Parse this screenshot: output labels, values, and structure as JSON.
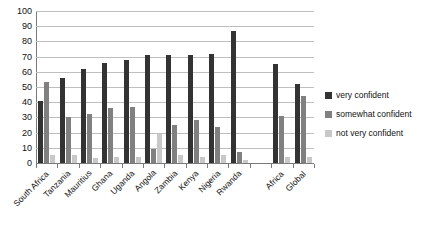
{
  "chart_data": {
    "type": "bar",
    "title": "",
    "subtitle": "",
    "xlabel": "",
    "ylabel": "",
    "ylim": [
      0,
      100
    ],
    "ytick_step": 10,
    "yticks": [
      "100",
      "90",
      "80",
      "70",
      "60",
      "50",
      "40",
      "30",
      "20",
      "10",
      "0"
    ],
    "grid": true,
    "legend_position": "right",
    "categories": [
      "South Africa",
      "Tanzania",
      "Mauritius",
      "Ghana",
      "Uganda",
      "Angola",
      "Zambia",
      "Kenya",
      "Nigeria",
      "Rwanda",
      "",
      "Africa",
      "Global"
    ],
    "series": [
      {
        "name": "very confident",
        "color": "#333333",
        "values": [
          41,
          56,
          62,
          66,
          68,
          71,
          71,
          71,
          72,
          87,
          null,
          65,
          52
        ]
      },
      {
        "name": "somewhat confident",
        "color": "#808080",
        "values": [
          53,
          30,
          32,
          36,
          37,
          9,
          25,
          28,
          24,
          7,
          null,
          31,
          44
        ]
      },
      {
        "name": "not very confident",
        "color": "#c8c8c8",
        "values": [
          5,
          5,
          3,
          4,
          4,
          19,
          5,
          4,
          5,
          2,
          null,
          4,
          4
        ]
      }
    ]
  },
  "legend": {
    "items": [
      {
        "label": "very confident",
        "swatch": "s0"
      },
      {
        "label": "somewhat confident",
        "swatch": "s1"
      },
      {
        "label": "not very confident",
        "swatch": "s2"
      }
    ]
  }
}
